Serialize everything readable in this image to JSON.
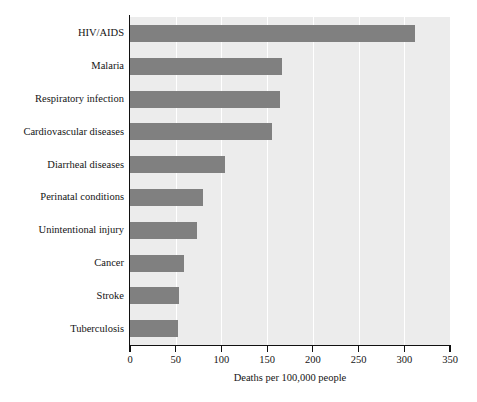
{
  "chart_data": {
    "type": "bar",
    "orientation": "horizontal",
    "title": "",
    "xlabel": "Deaths per 100,000 people",
    "ylabel": "",
    "xlim": [
      0,
      350
    ],
    "xticks": [
      0,
      50,
      100,
      150,
      200,
      250,
      300,
      350
    ],
    "xtick_labels": [
      "0",
      "50",
      "100",
      "150",
      "200",
      "250",
      "300",
      "350"
    ],
    "grid": "vertical-white-gridlines",
    "legend": "none",
    "categories": [
      "HIV/AIDS",
      "Malaria",
      "Respiratory infection",
      "Cardiovascular diseases",
      "Diarrheal diseases",
      "Perinatal conditions",
      "Unintentional injury",
      "Cancer",
      "Stroke",
      "Tuberculosis"
    ],
    "values": [
      312,
      166,
      164,
      155,
      104,
      80,
      73,
      59,
      54,
      52
    ],
    "bar_color": "#808080",
    "plot_background": "#ececec",
    "axis_color": "#111111",
    "gridline_color": "#ffffff"
  }
}
